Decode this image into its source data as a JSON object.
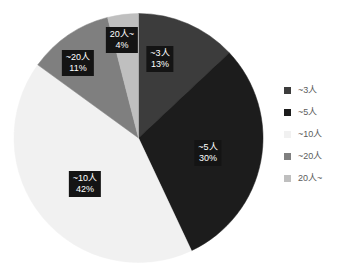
{
  "chart_data": {
    "type": "pie",
    "title": "",
    "xlabel": "",
    "ylabel": "",
    "legend_position": "right",
    "grid": false,
    "categories": [
      "~3人",
      "~5人",
      "~10人",
      "~20人",
      "20人~"
    ],
    "values": [
      13,
      30,
      42,
      11,
      4
    ],
    "value_unit": "%",
    "start_angle_deg": 0,
    "direction": "clockwise",
    "colors": [
      "#3c3c3c",
      "#1c1c1c",
      "#f1f1f1",
      "#7f7f7f",
      "#bfbfbf"
    ],
    "slices": [
      {
        "name": "~3人",
        "value": 13,
        "pct_label": "13%",
        "color": "#3c3c3c",
        "label_x": 160,
        "label_y": 59
      },
      {
        "name": "~5人",
        "value": 30,
        "pct_label": "30%",
        "color": "#1c1c1c",
        "label_x": 208,
        "label_y": 153
      },
      {
        "name": "~10人",
        "value": 42,
        "pct_label": "42%",
        "color": "#f1f1f1",
        "label_x": 85,
        "label_y": 184
      },
      {
        "name": "~20人",
        "value": 11,
        "pct_label": "11%",
        "color": "#7f7f7f",
        "label_x": 78,
        "label_y": 63
      },
      {
        "name": "20人~",
        "value": 4,
        "pct_label": "4%",
        "color": "#bfbfbf",
        "label_x": 122,
        "label_y": 40
      }
    ]
  },
  "legend": {
    "items": [
      {
        "label": "~3人",
        "color": "#3c3c3c"
      },
      {
        "label": "~5人",
        "color": "#1c1c1c"
      },
      {
        "label": "~10人",
        "color": "#f1f1f1"
      },
      {
        "label": "~20人",
        "color": "#7f7f7f"
      },
      {
        "label": "20人~",
        "color": "#bfbfbf"
      }
    ]
  }
}
